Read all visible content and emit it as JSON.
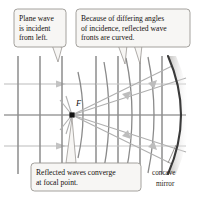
{
  "figure": {
    "background_color": "#ffffff"
  },
  "callouts": [
    {
      "id": "plane-wave",
      "lines": [
        "Plane wave",
        "is incident",
        "from left."
      ],
      "box": {
        "x": 14,
        "y": 9,
        "width": 52,
        "height": 38
      },
      "fill": "#f7f6f4",
      "stroke": "#9a9793"
    },
    {
      "id": "curved-fronts",
      "lines": [
        "Because of differing angles",
        "of incidence, reflected wave",
        "fronts are curved."
      ],
      "box": {
        "x": 76,
        "y": 9,
        "width": 114,
        "height": 38
      },
      "fill": "#f7f6f4",
      "stroke": "#9a9793"
    },
    {
      "id": "converge",
      "lines": [
        "Reflected waves converge",
        "at focal point."
      ],
      "box": {
        "x": 31,
        "y": 163,
        "width": 110,
        "height": 28
      },
      "fill": "#f7f6f4",
      "stroke": "#9a9793"
    }
  ],
  "labels": {
    "focal_point": "F",
    "mirror": [
      "concave",
      "mirror"
    ]
  },
  "colors": {
    "wavefront_vertical": "#8c8c8c",
    "ray_light": "#b9b9b9",
    "axis": "#6f6f6f",
    "mirror_stroke": "#3a3a3a",
    "mirror_shadow": "#c9c7c4",
    "callout_fill": "#f7f6f4",
    "callout_stroke": "#9a9793",
    "text": "#15110f",
    "focal_dot": "#141414"
  },
  "diagram_data": {
    "type": "optics-ray-diagram",
    "focal_point": {
      "x": 72,
      "y": 115
    },
    "optical_axis_y": 115,
    "incident_plane_wavefronts_x": [
      18,
      40,
      62
    ],
    "incident_ray_ys": [
      84,
      115,
      146
    ],
    "reflected_wavefront_arc_radii": [
      34,
      58,
      80,
      100
    ],
    "mirror": {
      "vertex_x": 186,
      "top": {
        "x": 168,
        "y": 56
      },
      "bottom": {
        "x": 168,
        "y": 174
      }
    },
    "grid_horizontal_ys": [
      84,
      115,
      146
    ],
    "grid_vertical_xs": [
      18,
      40,
      62,
      96,
      118,
      140,
      162
    ]
  }
}
